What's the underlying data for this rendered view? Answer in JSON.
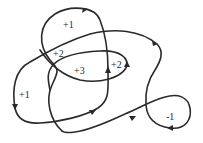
{
  "diagram": {
    "type": "closed-curve winding numbers",
    "stroke_color": "#2a2a2a",
    "background_color": "#ffffff",
    "region_labels": [
      {
        "id": "top-loop",
        "text": "+1"
      },
      {
        "id": "upper-left",
        "text": "+2"
      },
      {
        "id": "center",
        "text": "+3"
      },
      {
        "id": "center-right",
        "text": "+2"
      },
      {
        "id": "left",
        "text": "+1"
      },
      {
        "id": "right-loop",
        "text": "-1"
      }
    ]
  }
}
